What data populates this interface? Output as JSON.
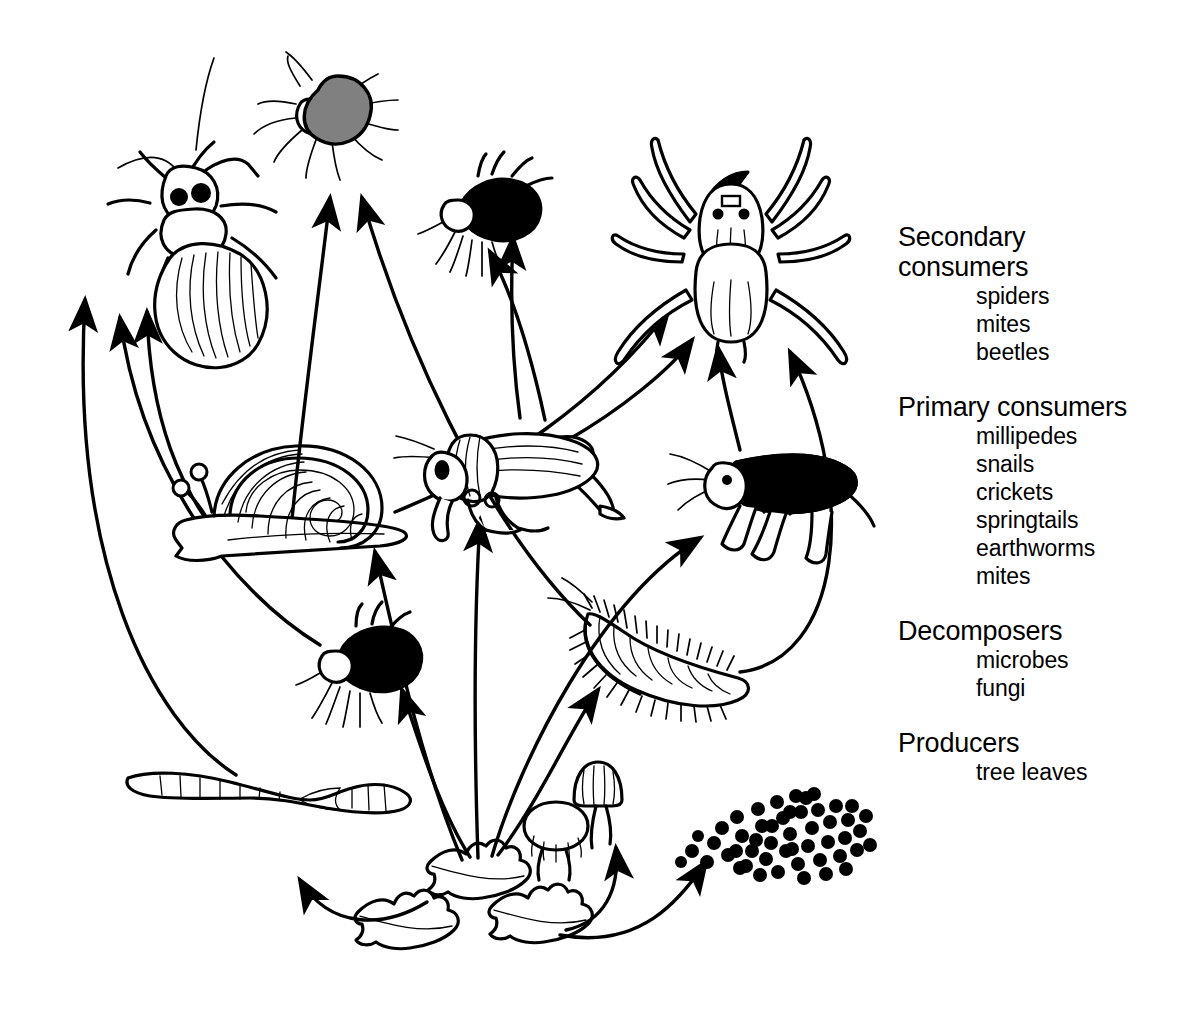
{
  "diagram": {
    "type": "food-web",
    "background_color": "#ffffff",
    "ink_color": "#000000",
    "mite_fill": "#000000",
    "tick_fill": "#808080"
  },
  "legend": {
    "groups": [
      {
        "id": "secondary-consumers",
        "heading": "Secondary consumers",
        "heading_lines": [
          "Secondary",
          "consumers"
        ],
        "items": [
          "spiders",
          "mites",
          "beetles"
        ]
      },
      {
        "id": "primary-consumers",
        "heading": "Primary consumers",
        "heading_lines": [
          "Primary consumers"
        ],
        "items": [
          "millipedes",
          "snails",
          "crickets",
          "springtails",
          "earthworms",
          "mites"
        ]
      },
      {
        "id": "decomposers",
        "heading": "Decomposers",
        "heading_lines": [
          "Decomposers"
        ],
        "items": [
          "microbes",
          "fungi"
        ]
      },
      {
        "id": "producers",
        "heading": "Producers",
        "heading_lines": [
          "Producers"
        ],
        "items": [
          "tree leaves"
        ]
      }
    ]
  },
  "organisms": [
    {
      "id": "beetle",
      "label": "beetle",
      "trophic": "secondary-consumers",
      "x": 175,
      "y": 215
    },
    {
      "id": "tick-mite-top",
      "label": "mite",
      "trophic": "secondary-consumers",
      "x": 325,
      "y": 112
    },
    {
      "id": "mite-upper",
      "label": "mite",
      "trophic": "secondary-consumers",
      "x": 489,
      "y": 205
    },
    {
      "id": "spider",
      "label": "spider",
      "trophic": "secondary-consumers",
      "x": 731,
      "y": 245
    },
    {
      "id": "snail",
      "label": "snail",
      "trophic": "primary-consumers",
      "x": 277,
      "y": 500
    },
    {
      "id": "cricket",
      "label": "cricket",
      "trophic": "primary-consumers",
      "x": 510,
      "y": 470
    },
    {
      "id": "springtail",
      "label": "springtail",
      "trophic": "primary-consumers",
      "x": 775,
      "y": 498
    },
    {
      "id": "mite-lower",
      "label": "mite",
      "trophic": "primary-consumers",
      "x": 355,
      "y": 660
    },
    {
      "id": "millipede",
      "label": "millipede",
      "trophic": "primary-consumers",
      "x": 655,
      "y": 650
    },
    {
      "id": "earthworm",
      "label": "earthworm",
      "trophic": "primary-consumers",
      "x": 268,
      "y": 792
    },
    {
      "id": "fungi",
      "label": "fungi",
      "trophic": "decomposers",
      "x": 580,
      "y": 810
    },
    {
      "id": "microbes",
      "label": "microbes",
      "trophic": "decomposers",
      "x": 775,
      "y": 835
    },
    {
      "id": "leaf-center",
      "label": "tree leaf",
      "trophic": "producers",
      "x": 470,
      "y": 875
    },
    {
      "id": "leaf-left",
      "label": "tree leaf",
      "trophic": "producers",
      "x": 398,
      "y": 925
    },
    {
      "id": "leaf-right",
      "label": "tree leaf",
      "trophic": "producers",
      "x": 530,
      "y": 920
    }
  ],
  "flows": [
    {
      "from": "tree-leaves",
      "to": "earthworm"
    },
    {
      "from": "tree-leaves",
      "to": "fungi"
    },
    {
      "from": "tree-leaves",
      "to": "microbes"
    },
    {
      "from": "tree-leaves",
      "to": "mite-lower"
    },
    {
      "from": "tree-leaves",
      "to": "millipede"
    },
    {
      "from": "tree-leaves",
      "to": "snail"
    },
    {
      "from": "tree-leaves",
      "to": "cricket"
    },
    {
      "from": "tree-leaves",
      "to": "springtail"
    },
    {
      "from": "earthworm",
      "to": "beetle"
    },
    {
      "from": "mite-lower",
      "to": "beetle"
    },
    {
      "from": "snail",
      "to": "beetle"
    },
    {
      "from": "millipede",
      "to": "spider"
    },
    {
      "from": "springtail",
      "to": "spider"
    },
    {
      "from": "cricket",
      "to": "spider"
    },
    {
      "from": "snail",
      "to": "spider"
    },
    {
      "from": "millipede",
      "to": "tick-mite-top"
    },
    {
      "from": "snail",
      "to": "tick-mite-top"
    },
    {
      "from": "cricket",
      "to": "mite-upper"
    },
    {
      "from": "springtail",
      "to": "mite-upper"
    }
  ]
}
